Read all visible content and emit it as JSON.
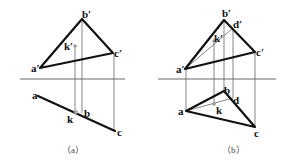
{
  "figure": {
    "panels": [
      {
        "id": "a",
        "caption": "（a）",
        "labels": {
          "a_prime": "a′",
          "b_prime": "b′",
          "c_prime": "c′",
          "k_prime": "k′",
          "a": "a",
          "b": "b",
          "c": "c",
          "k": "k"
        }
      },
      {
        "id": "b",
        "caption": "（b）",
        "labels": {
          "a_prime": "a′",
          "b_prime": "b′",
          "c_prime": "c′",
          "d_prime": "d′",
          "k_prime": "k′",
          "a": "a",
          "b": "b",
          "c": "c",
          "d": "d",
          "k": "k"
        }
      }
    ],
    "colors": {
      "object_lines": "#111111",
      "projection_lines": "#666666",
      "axis": "#555555",
      "point_marker": "#999999"
    }
  }
}
